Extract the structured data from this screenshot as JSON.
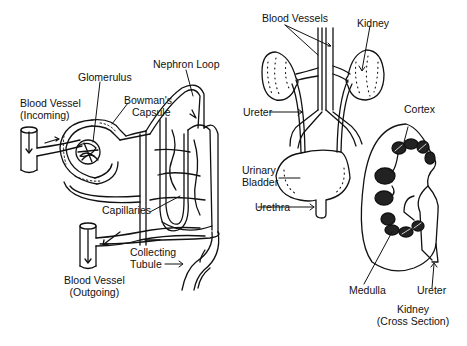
{
  "nephron": {
    "blood_vessel_in_line1": "Blood Vessel",
    "blood_vessel_in_line2": "(Incoming)",
    "glomerulus": "Glomerulus",
    "bowmans_line1": "Bowman's",
    "bowmans_line2": "Capsule",
    "nephron_loop": "Nephron Loop",
    "capillaries": "Capillaries",
    "collecting_line1": "Collecting",
    "collecting_line2": "Tubule",
    "blood_vessel_out_line1": "Blood Vessel",
    "blood_vessel_out_line2": "(Outgoing)"
  },
  "urinary_system": {
    "blood_vessels": "Blood Vessels",
    "kidney": "Kidney",
    "ureter": "Ureter",
    "bladder_line1": "Urinary",
    "bladder_line2": "Bladder",
    "urethra": "Urethra"
  },
  "kidney_section": {
    "cortex": "Cortex",
    "medulla": "Medulla",
    "ureter": "Ureter",
    "caption_line1": "Kidney",
    "caption_line2": "(Cross Section)"
  },
  "colors": {
    "ink": "#111111",
    "background": "#ffffff"
  }
}
